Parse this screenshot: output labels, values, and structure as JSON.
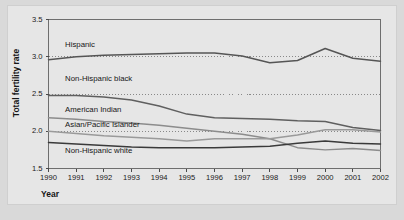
{
  "figure": {
    "background_color": "#d9d9d9",
    "panel_color": "#e6e6e6",
    "frame_color": "#6e6e6e"
  },
  "chart_data": {
    "type": "line",
    "title": "",
    "xlabel": "Year",
    "ylabel": "Total fertility rate",
    "xlim": [
      1990,
      2002
    ],
    "ylim": [
      1.5,
      3.5
    ],
    "yticks": [
      "1.5",
      "2.0",
      "2.5",
      "3.0",
      "3.5"
    ],
    "ytick_values": [
      1.5,
      2.0,
      2.5,
      3.0,
      3.5
    ],
    "grid": "horizontal dotted gridlines at 2.0, 2.5, 3.0",
    "legend_position": "inline labels on plot",
    "categories": [
      1990,
      1991,
      1992,
      1993,
      1994,
      1995,
      1996,
      1997,
      1998,
      1999,
      2000,
      2001,
      2002
    ],
    "xtick_labels": [
      "1990",
      "1991",
      "1992",
      "1993",
      "1994",
      "1995",
      "1996",
      "1997",
      "1998",
      "1999",
      "2000",
      "2001",
      "2002"
    ],
    "series": [
      {
        "name": "Hispanic",
        "color": "#555555",
        "label_x": 1990.6,
        "label_y": 3.16,
        "values": [
          2.96,
          3.0,
          3.02,
          3.03,
          3.04,
          3.05,
          3.05,
          3.01,
          2.92,
          2.95,
          3.11,
          2.98,
          2.94
        ]
      },
      {
        "name": "Non-Hispanic black",
        "color": "#5f5f5f",
        "label_x": 1990.6,
        "label_y": 2.7,
        "values": [
          2.48,
          2.48,
          2.46,
          2.42,
          2.34,
          2.23,
          2.18,
          2.17,
          2.16,
          2.14,
          2.13,
          2.05,
          2.01
        ]
      },
      {
        "name": "American Indian",
        "color": "#8c8c8c",
        "label_x": 1990.6,
        "label_y": 2.28,
        "values": [
          2.18,
          2.16,
          2.13,
          2.11,
          2.08,
          2.04,
          2.0,
          1.96,
          1.9,
          1.78,
          1.75,
          1.77,
          1.74
        ]
      },
      {
        "name": "Asian/Pacific Islander",
        "color": "#9a9a9a",
        "label_x": 1990.6,
        "label_y": 2.09,
        "values": [
          2.0,
          1.97,
          1.94,
          1.92,
          1.9,
          1.87,
          1.9,
          1.9,
          1.9,
          1.95,
          2.02,
          2.02,
          1.99
        ]
      },
      {
        "name": "Non-Hispanic white",
        "color": "#3a3a3a",
        "label_x": 1990.6,
        "label_y": 1.74,
        "values": [
          1.85,
          1.83,
          1.81,
          1.79,
          1.78,
          1.78,
          1.78,
          1.79,
          1.8,
          1.84,
          1.87,
          1.84,
          1.83
        ]
      }
    ]
  }
}
